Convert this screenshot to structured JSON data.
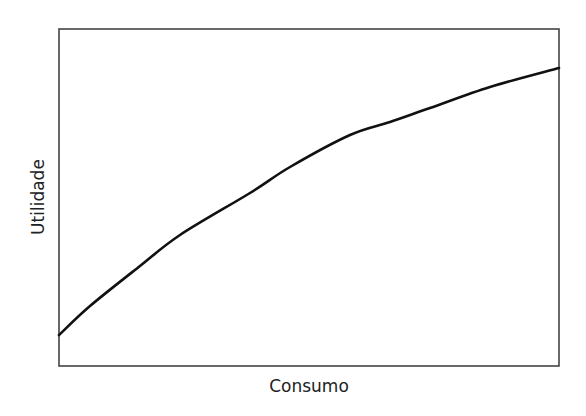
{
  "chart_data": {
    "type": "line",
    "title": "",
    "xlabel": "Consumo",
    "ylabel": "Utilidade",
    "grid": false,
    "legend": null,
    "ticks": {
      "x": [],
      "y": []
    },
    "xlim": [
      0,
      500
    ],
    "ylim": [
      0,
      337
    ],
    "series": [
      {
        "name": "Utilidade",
        "shape": "concave increasing (diminishing marginal utility)",
        "x": [
          0,
          31,
          81,
          121,
          191,
          231,
          291,
          331,
          371,
          431,
          500
        ],
        "y": [
          31,
          60,
          100,
          131,
          173,
          199,
          231,
          244,
          258,
          279,
          298
        ]
      }
    ]
  },
  "colors": {
    "curve": "#111111",
    "frame": "#444444",
    "background": "#ffffff",
    "text": "#222222"
  }
}
